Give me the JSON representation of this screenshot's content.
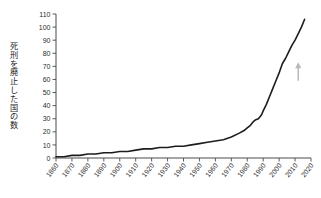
{
  "chart_data": {
    "type": "line",
    "title": "",
    "subtitle": "",
    "xlabel": "",
    "ylabel": "死刑を廃止した国の数",
    "xlim": [
      1860,
      2020
    ],
    "ylim": [
      0,
      110
    ],
    "grid": false,
    "legend": null,
    "legend_position": "none",
    "line_color": "#1d1d1d",
    "axis_color": "#4a4a4a",
    "background": "#ffffff",
    "x_ticks": [
      1860,
      1870,
      1880,
      1890,
      1900,
      1910,
      1920,
      1930,
      1940,
      1950,
      1960,
      1970,
      1980,
      1990,
      2000,
      2010,
      2020
    ],
    "x_tick_labels": [
      "1860",
      "1870",
      "1880",
      "1890",
      "1900",
      "1910",
      "1920",
      "1930",
      "1940",
      "1950",
      "1960",
      "1970",
      "1980",
      "1990",
      "2000",
      "2010",
      "2020"
    ],
    "y_ticks": [
      0,
      10,
      20,
      30,
      40,
      50,
      60,
      70,
      80,
      90,
      100,
      110
    ],
    "y_tick_labels": [
      "0",
      "10",
      "20",
      "30",
      "40",
      "50",
      "60",
      "70",
      "80",
      "90",
      "100",
      "110"
    ],
    "series": [
      {
        "name": "死刑を廃止した国の数",
        "x": [
          1860,
          1865,
          1870,
          1875,
          1880,
          1885,
          1890,
          1895,
          1900,
          1905,
          1910,
          1915,
          1920,
          1925,
          1930,
          1935,
          1940,
          1945,
          1950,
          1955,
          1960,
          1965,
          1970,
          1975,
          1978,
          1980,
          1982,
          1984,
          1985,
          1987,
          1989,
          1990,
          1992,
          1994,
          1996,
          1998,
          2000,
          2002,
          2004,
          2006,
          2008,
          2010,
          2012,
          2014,
          2016
        ],
        "y": [
          1,
          1,
          2,
          2,
          3,
          3,
          4,
          4,
          5,
          5,
          6,
          7,
          7,
          8,
          8,
          9,
          9,
          10,
          11,
          12,
          13,
          14,
          16,
          19,
          21,
          23,
          25,
          28,
          29,
          30,
          33,
          36,
          41,
          47,
          53,
          59,
          65,
          72,
          76,
          81,
          86,
          90,
          95,
          100,
          106
        ],
        "color": "#1d1d1d"
      }
    ],
    "annotations": [
      {
        "name": "up-arrow",
        "x": 2012,
        "y": 72,
        "color": "#b9b9b9",
        "text": ""
      }
    ]
  }
}
